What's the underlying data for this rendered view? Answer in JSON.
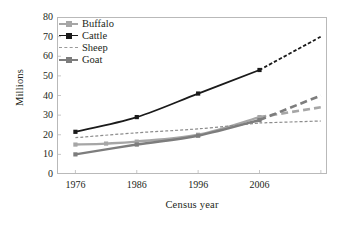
{
  "chart_data": {
    "type": "line",
    "title": "",
    "xlabel": "Census year",
    "ylabel": "Millions",
    "xlim": [
      1973,
      2017
    ],
    "ylim": [
      0,
      80
    ],
    "yticks": [
      0,
      10,
      20,
      30,
      40,
      50,
      60,
      70,
      80
    ],
    "xticks": [
      1976,
      1986,
      1996,
      2006
    ],
    "grid": false,
    "legend_position": "top-left",
    "series": [
      {
        "name": "Buffalo",
        "color": "#a6a6a6",
        "marker": "square",
        "linestyle_observed": "solid",
        "linestyle_projected": "dashed",
        "x": [
          1976,
          1981,
          1986,
          1996,
          2006,
          2016
        ],
        "values": [
          15.0,
          15.5,
          16.5,
          20.0,
          29.0,
          34.0
        ]
      },
      {
        "name": "Cattle",
        "color": "#1a1a1a",
        "marker": "square",
        "linestyle_observed": "solid",
        "linestyle_projected": "dashed",
        "x": [
          1976,
          1986,
          1996,
          2006,
          2016
        ],
        "values": [
          21.5,
          29.0,
          41.0,
          53.0,
          70.0
        ]
      },
      {
        "name": "Sheep",
        "color": "#8c8c8c",
        "marker": "none",
        "linestyle_observed": "dashed",
        "linestyle_projected": "dashed",
        "x": [
          1976,
          1986,
          1996,
          2006,
          2016
        ],
        "values": [
          18.5,
          21.0,
          23.0,
          26.0,
          27.0
        ]
      },
      {
        "name": "Goat",
        "color": "#7d7d7d",
        "marker": "square",
        "linestyle_observed": "solid",
        "linestyle_projected": "dashed",
        "x": [
          1976,
          1986,
          1996,
          2006,
          2016
        ],
        "values": [
          10.0,
          15.0,
          19.5,
          27.5,
          40.0
        ]
      }
    ]
  },
  "axes": {
    "y_title": "Millions",
    "x_title": "Census year",
    "y_tick_labels": [
      "80",
      "70",
      "60",
      "50",
      "40",
      "30",
      "20",
      "10",
      "0"
    ],
    "x_tick_labels": [
      "1976",
      "1986",
      "1996",
      "2006"
    ]
  },
  "legend": {
    "items": [
      {
        "label": "Buffalo",
        "color": "#a6a6a6",
        "marker": "square",
        "dashed": false
      },
      {
        "label": "Cattle",
        "color": "#1a1a1a",
        "marker": "square",
        "dashed": false
      },
      {
        "label": "Sheep",
        "color": "#9a9a9a",
        "marker": "none",
        "dashed": true
      },
      {
        "label": "Goat",
        "color": "#7d7d7d",
        "marker": "square",
        "dashed": false
      }
    ]
  },
  "style": {
    "background": "#ffffff",
    "frame_color": "#b9b9b9",
    "text_color": "#231f20"
  }
}
